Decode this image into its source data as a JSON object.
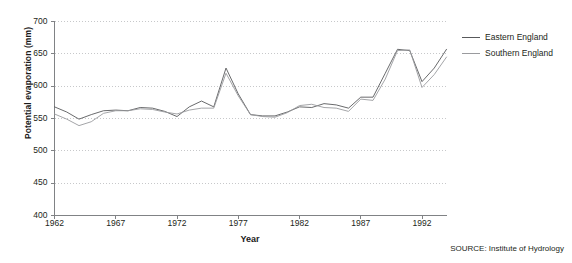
{
  "chart_data": {
    "type": "line",
    "title": "",
    "xlabel": "Year",
    "ylabel": "Potential evaporation (mm)",
    "xlim": [
      1962,
      1994
    ],
    "ylim": [
      400,
      700
    ],
    "ytick_values": [
      400,
      450,
      500,
      550,
      600,
      650,
      700
    ],
    "ytick_labels": [
      "400",
      "450",
      "500",
      "550",
      "600",
      "650",
      "700"
    ],
    "xtick_values": [
      1962,
      1967,
      1972,
      1977,
      1982,
      1987,
      1992
    ],
    "xtick_labels": [
      "1962",
      "1967",
      "1972",
      "1977",
      "1982",
      "1987",
      "1992"
    ],
    "grid": "horizontal-dotted",
    "legend_position": "right",
    "x": [
      1962,
      1963,
      1964,
      1965,
      1966,
      1967,
      1968,
      1969,
      1970,
      1971,
      1972,
      1973,
      1974,
      1975,
      1976,
      1977,
      1978,
      1979,
      1980,
      1981,
      1982,
      1983,
      1984,
      1985,
      1986,
      1987,
      1988,
      1989,
      1990,
      1991,
      1992,
      1993,
      1994
    ],
    "series": [
      {
        "name": "Eastern England",
        "color": "#58595b",
        "values": [
          568,
          560,
          549,
          556,
          562,
          563,
          562,
          567,
          566,
          561,
          553,
          568,
          577,
          568,
          628,
          588,
          556,
          554,
          554,
          560,
          568,
          567,
          573,
          571,
          566,
          583,
          583,
          620,
          657,
          655,
          607,
          628,
          657
        ]
      },
      {
        "name": "Southern England",
        "color": "#9a9b9e",
        "values": [
          557,
          549,
          539,
          545,
          558,
          562,
          562,
          565,
          564,
          560,
          557,
          563,
          566,
          566,
          620,
          585,
          556,
          553,
          552,
          559,
          570,
          572,
          567,
          566,
          561,
          580,
          578,
          611,
          655,
          656,
          598,
          618,
          645
        ]
      }
    ],
    "source_note": "SOURCE: Institute of Hydrology"
  },
  "legend": {
    "items": [
      {
        "label": "Eastern England"
      },
      {
        "label": "Southern England"
      }
    ]
  },
  "axis": {
    "x_title": "Year",
    "y_title": "Potential evaporation (mm)"
  },
  "footer": {
    "source": "SOURCE: Institute of Hydrology"
  },
  "colors": {
    "eastern": "#58595b",
    "southern": "#9a9b9e",
    "axis": "#808285",
    "grid": "#c7c8ca",
    "text": "#231f20"
  }
}
